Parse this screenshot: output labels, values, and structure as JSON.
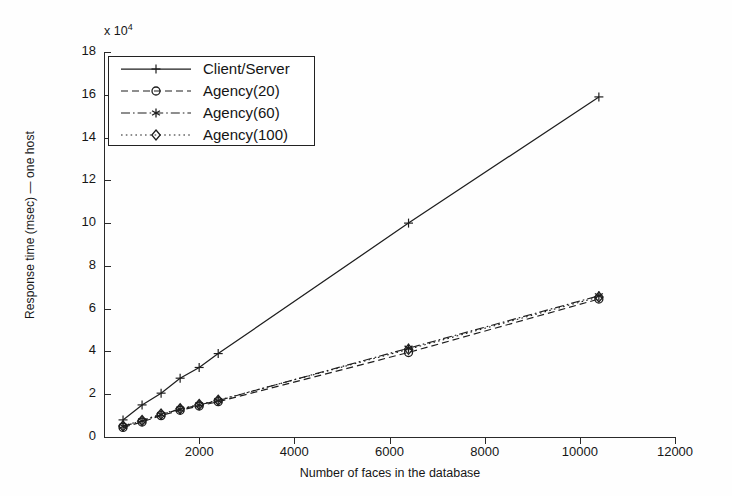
{
  "figure": {
    "multiplier_label": "x 10",
    "multiplier_exp": "4",
    "xlabel": "Number of faces in the database",
    "ylabel": "Response time (msec) — one host"
  },
  "axes": {
    "xticks": [
      0,
      2000,
      4000,
      6000,
      8000,
      10000,
      12000
    ],
    "xtick_labels": [
      "",
      "2000",
      "4000",
      "6000",
      "8000",
      "10000",
      "12000"
    ],
    "yticks": [
      0,
      2,
      4,
      6,
      8,
      10,
      12,
      14,
      16,
      18
    ],
    "ytick_labels": [
      "0",
      "2",
      "4",
      "6",
      "8",
      "10",
      "12",
      "14",
      "16",
      "18"
    ],
    "xlim": [
      0,
      12000
    ],
    "ylim": [
      0,
      18
    ]
  },
  "legend": {
    "entries": [
      {
        "label": "Client/Server",
        "style": "solid",
        "marker": "plus"
      },
      {
        "label": "Agency(20)",
        "style": "dashed",
        "marker": "circle"
      },
      {
        "label": "Agency(60)",
        "style": "dashdot",
        "marker": "asterisk"
      },
      {
        "label": "Agency(100)",
        "style": "dotted",
        "marker": "diamond"
      }
    ]
  },
  "colors": {
    "line": "#1e1e1e",
    "axis": "#2a2a2a",
    "background": "#fefefe"
  },
  "chart_data": {
    "type": "line",
    "title": "",
    "xlabel": "Number of faces in the database",
    "ylabel": "Response time (msec) — one host",
    "y_multiplier": 10000,
    "xlim": [
      0,
      12000
    ],
    "ylim": [
      0,
      180000
    ],
    "grid": false,
    "legend_position": "upper-left",
    "series": [
      {
        "name": "Client/Server",
        "style": "solid",
        "marker": "plus",
        "x": [
          400,
          800,
          1200,
          1600,
          2000,
          2400,
          6400,
          10400
        ],
        "y": [
          8000,
          15000,
          20500,
          27500,
          32500,
          39000,
          100000,
          159000
        ]
      },
      {
        "name": "Agency(20)",
        "style": "dashed",
        "marker": "circle",
        "x": [
          400,
          800,
          1200,
          1600,
          2000,
          2400,
          6400,
          10400
        ],
        "y": [
          4500,
          7000,
          10000,
          12500,
          14500,
          16500,
          39500,
          64500
        ]
      },
      {
        "name": "Agency(60)",
        "style": "dashdot",
        "marker": "asterisk",
        "x": [
          400,
          800,
          1200,
          1600,
          2000,
          2400,
          6400,
          10400
        ],
        "y": [
          5000,
          7500,
          10500,
          13000,
          15000,
          17000,
          41500,
          66000
        ]
      },
      {
        "name": "Agency(100)",
        "style": "dotted",
        "marker": "diamond",
        "x": [
          400,
          800,
          1200,
          1600,
          2000,
          2400,
          6400,
          10400
        ],
        "y": [
          5200,
          7700,
          10700,
          13200,
          15200,
          17200,
          41000,
          65500
        ]
      }
    ]
  }
}
